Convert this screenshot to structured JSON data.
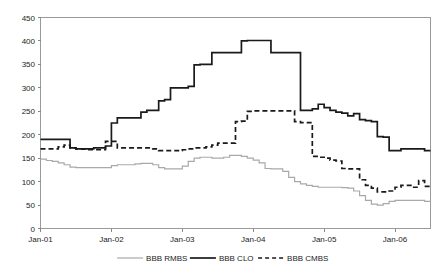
{
  "chart_data": {
    "type": "line",
    "title": "",
    "subtitle": "",
    "xlabel": "",
    "ylabel": "",
    "ylim": [
      0,
      450
    ],
    "ytick_step": 50,
    "yticks": [
      0,
      50,
      100,
      150,
      200,
      250,
      300,
      350,
      400,
      450
    ],
    "xticks": [
      "Jan-01",
      "Jan-02",
      "Jan-03",
      "Jan-04",
      "Jan-05",
      "Jan-06"
    ],
    "xlim": [
      "Jan-01",
      "Jul-06"
    ],
    "x_unit": "month",
    "x_count": 67,
    "grid": false,
    "legend_position": "bottom-center",
    "series": [
      {
        "name": "BBB RMBS",
        "color": "#a9a9a9",
        "style": "solid",
        "width": 1.2,
        "values": [
          148,
          145,
          143,
          140,
          136,
          131,
          130,
          130,
          130,
          130,
          130,
          130,
          134,
          136,
          136,
          136,
          138,
          139,
          139,
          136,
          130,
          127,
          127,
          127,
          133,
          143,
          150,
          152,
          152,
          150,
          150,
          152,
          156,
          156,
          154,
          150,
          146,
          140,
          128,
          127,
          127,
          122,
          109,
          100,
          95,
          92,
          90,
          88,
          88,
          88,
          88,
          87,
          86,
          80,
          70,
          60,
          52,
          50,
          53,
          58,
          60,
          60,
          60,
          60,
          60,
          58,
          56
        ]
      },
      {
        "name": "BBB CLO",
        "color": "#1a1a1a",
        "style": "solid",
        "width": 1.7,
        "values": [
          190,
          190,
          190,
          190,
          190,
          172,
          170,
          170,
          170,
          172,
          172,
          176,
          225,
          236,
          236,
          236,
          236,
          248,
          252,
          252,
          272,
          275,
          300,
          300,
          300,
          303,
          349,
          350,
          350,
          375,
          375,
          375,
          375,
          375,
          400,
          401,
          401,
          401,
          401,
          375,
          375,
          375,
          375,
          375,
          252,
          252,
          255,
          265,
          258,
          252,
          248,
          246,
          240,
          245,
          232,
          230,
          228,
          196,
          195,
          166,
          166,
          170,
          170,
          170,
          170,
          166,
          166
        ]
      },
      {
        "name": "BBB CMBS",
        "color": "#1a1a1a",
        "style": "dashed",
        "width": 1.7,
        "values": [
          170,
          170,
          170,
          174,
          178,
          172,
          170,
          169,
          168,
          168,
          168,
          186,
          186,
          172,
          172,
          172,
          172,
          172,
          172,
          170,
          166,
          166,
          166,
          166,
          168,
          170,
          172,
          172,
          174,
          178,
          182,
          182,
          182,
          228,
          229,
          250,
          251,
          251,
          251,
          251,
          251,
          251,
          251,
          228,
          226,
          226,
          154,
          152,
          150,
          146,
          144,
          128,
          127,
          127,
          104,
          92,
          86,
          78,
          78,
          80,
          88,
          92,
          92,
          88,
          102,
          90,
          87
        ]
      }
    ]
  },
  "legend": {
    "items": [
      {
        "label": "BBB RMBS",
        "marker": "line-solid-gray"
      },
      {
        "label": "BBB CLO",
        "marker": "line-solid-black"
      },
      {
        "label": "BBB CMBS",
        "marker": "line-dashed-black"
      }
    ]
  },
  "colors": {
    "rmbs": "#a9a9a9",
    "clo": "#1a1a1a",
    "cmbs": "#1a1a1a",
    "frame": "#9a9a9a",
    "background": "#ffffff",
    "text": "#1c1c1c"
  }
}
